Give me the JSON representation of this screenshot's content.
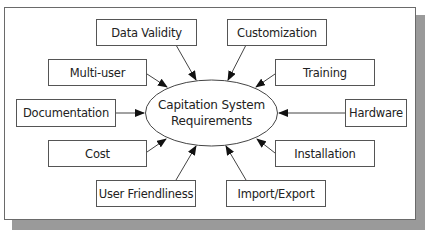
{
  "diagram": {
    "center": {
      "line1": "Capitation System",
      "line2": "Requirements"
    },
    "nodes": [
      {
        "id": "data-validity",
        "label": "Data Validity"
      },
      {
        "id": "customization",
        "label": "Customization"
      },
      {
        "id": "multi-user",
        "label": "Multi-user"
      },
      {
        "id": "training",
        "label": "Training"
      },
      {
        "id": "documentation",
        "label": "Documentation"
      },
      {
        "id": "hardware",
        "label": "Hardware"
      },
      {
        "id": "cost",
        "label": "Cost"
      },
      {
        "id": "installation",
        "label": "Installation"
      },
      {
        "id": "user-friendliness",
        "label": "User Friendliness"
      },
      {
        "id": "import-export",
        "label": "Import/Export"
      }
    ],
    "edges_direction": "node-to-center",
    "colors": {
      "border": "#555555",
      "shadow": "#9a9a9a",
      "text": "#222222"
    }
  }
}
